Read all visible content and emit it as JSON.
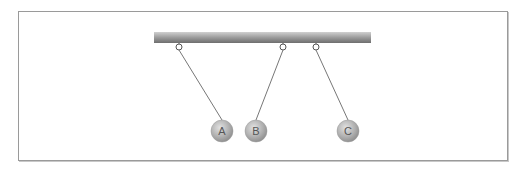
{
  "diagram": {
    "bar": {
      "x1": 154,
      "x2": 371,
      "y": 32,
      "height": 11
    },
    "pendulums": [
      {
        "label": "A",
        "pivot": [
          179,
          47
        ],
        "bob": [
          222,
          131
        ]
      },
      {
        "label": "B",
        "pivot": [
          283,
          47
        ],
        "bob": [
          256,
          131
        ]
      },
      {
        "label": "C",
        "pivot": [
          316,
          47
        ],
        "bob": [
          348,
          131
        ]
      }
    ],
    "bob_radius": 11,
    "colors": {
      "frame": "#9a9a9a",
      "string": "#777777",
      "bob": "#b4b4b4",
      "label": "#555555"
    }
  }
}
